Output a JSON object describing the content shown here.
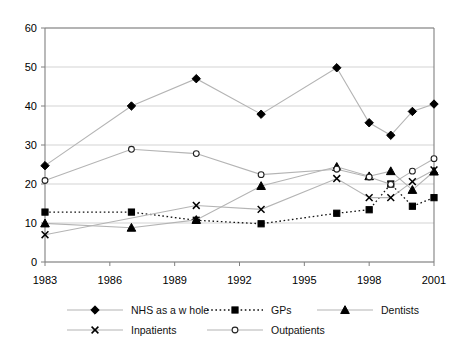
{
  "chart_data": {
    "type": "line",
    "title": "",
    "xlabel": "",
    "ylabel": "",
    "xlim": [
      1983,
      2001
    ],
    "ylim": [
      0,
      60
    ],
    "ytick_values": [
      0,
      10,
      20,
      30,
      40,
      50,
      60
    ],
    "ytick_labels": [
      "0",
      "10",
      "20",
      "30",
      "40",
      "50",
      "60"
    ],
    "xtick_values": [
      1983,
      1986,
      1989,
      1992,
      1995,
      1998,
      2001
    ],
    "xtick_labels": [
      "1983",
      "1986",
      "1989",
      "1992",
      "1995",
      "1998",
      "2001"
    ],
    "grid": "horizontal",
    "legend_position": "bottom",
    "series": [
      {
        "name": "NHS as a w hole",
        "marker": "filled-diamond",
        "line": "solid",
        "x": [
          1983,
          1987,
          1990,
          1993,
          1996.5,
          1998,
          1999,
          2000,
          2001
        ],
        "values": [
          24.7,
          40.0,
          47.0,
          37.9,
          49.8,
          35.7,
          32.5,
          38.6,
          40.5
        ]
      },
      {
        "name": "GPs",
        "marker": "filled-square",
        "line": "dotted",
        "x": [
          1983,
          1987,
          1990,
          1993,
          1996.5,
          1998,
          1999,
          2000,
          2001
        ],
        "values": [
          12.8,
          12.8,
          10.7,
          9.8,
          12.5,
          13.4,
          20.0,
          14.3,
          16.5
        ]
      },
      {
        "name": "Dentists",
        "marker": "filled-triangle",
        "line": "solid",
        "x": [
          1983,
          1987,
          1990,
          1993,
          1996.5,
          1998,
          1999,
          2000,
          2001
        ],
        "values": [
          9.9,
          8.8,
          10.8,
          19.5,
          24.4,
          22.0,
          23.3,
          18.5,
          23.2
        ]
      },
      {
        "name": "Inpatients",
        "marker": "cross-x",
        "line": "solid",
        "x": [
          1983,
          1990,
          1993,
          1996.5,
          1998,
          1999,
          2000,
          2001
        ],
        "values": [
          7.0,
          14.5,
          13.5,
          21.4,
          16.5,
          16.5,
          20.6,
          23.6
        ]
      },
      {
        "name": "Outpatients",
        "marker": "open-circle",
        "line": "solid",
        "x": [
          1983,
          1987,
          1990,
          1993,
          1996.5,
          1998,
          1999,
          2000,
          2001
        ],
        "values": [
          20.9,
          28.9,
          27.8,
          22.4,
          23.8,
          21.8,
          19.9,
          23.3,
          26.5
        ]
      }
    ],
    "legend": [
      {
        "label": "NHS as a w hole",
        "marker": "filled-diamond",
        "line": "solid"
      },
      {
        "label": "GPs",
        "marker": "filled-square",
        "line": "dotted"
      },
      {
        "label": "Dentists",
        "marker": "filled-triangle",
        "line": "solid"
      },
      {
        "label": "Inpatients",
        "marker": "cross-x",
        "line": "solid"
      },
      {
        "label": "Outpatients",
        "marker": "open-circle",
        "line": "solid"
      }
    ],
    "colors": {
      "series_line": "#b4b4b4",
      "marker": "#000000",
      "grid": "#c8c8c8",
      "axis": "#808080",
      "text": "#000000",
      "background": "#ffffff"
    }
  }
}
